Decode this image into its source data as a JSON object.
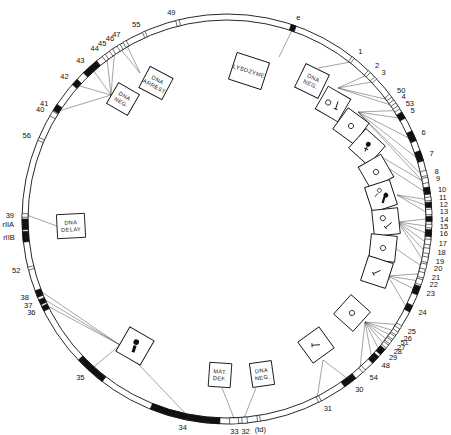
{
  "diagram": {
    "center": [
      227,
      219
    ],
    "outer_radius": 205,
    "inner_radius": 199,
    "colors": {
      "line": "#111111",
      "connector": "#333333",
      "background": "#ffffff",
      "gene_fill": "#111111"
    }
  },
  "genes": [
    {
      "label": "49",
      "angle": -14,
      "filled": false,
      "span": 1
    },
    {
      "label": "e",
      "angle": 19,
      "filled": true,
      "span": 1.5
    },
    {
      "label": "1",
      "angle": 38,
      "filled": false,
      "span": 0.8
    },
    {
      "label": "2",
      "angle": 44,
      "filled": false,
      "span": 0.8
    },
    {
      "label": "3",
      "angle": 46.5,
      "filled": false,
      "span": 0.8
    },
    {
      "label": "50",
      "angle": 53,
      "filled": false,
      "span": 1
    },
    {
      "label": "4",
      "angle": 55,
      "filled": false,
      "span": 1
    },
    {
      "label": "53",
      "angle": 57,
      "filled": false,
      "span": 1
    },
    {
      "label": "5",
      "angle": 59.5,
      "filled": true,
      "span": 2
    },
    {
      "label": "6",
      "angle": 66,
      "filled": true,
      "span": 3
    },
    {
      "label": "7",
      "angle": 72,
      "filled": true,
      "span": 3
    },
    {
      "label": "8",
      "angle": 77,
      "filled": false,
      "span": 1.5
    },
    {
      "label": "9",
      "angle": 79,
      "filled": false,
      "span": 1.5
    },
    {
      "label": "10",
      "angle": 82,
      "filled": true,
      "span": 2
    },
    {
      "label": "11",
      "angle": 84.3,
      "filled": false,
      "span": 1
    },
    {
      "label": "12",
      "angle": 86,
      "filled": true,
      "span": 1.5
    },
    {
      "label": "13",
      "angle": 88,
      "filled": false,
      "span": 1.5
    },
    {
      "label": "14",
      "angle": 90,
      "filled": true,
      "span": 1.5
    },
    {
      "label": "15",
      "angle": 92,
      "filled": false,
      "span": 1
    },
    {
      "label": "16",
      "angle": 94,
      "filled": true,
      "span": 2
    },
    {
      "label": "17",
      "angle": 96.5,
      "filled": false,
      "span": 1.5
    },
    {
      "label": "18",
      "angle": 99,
      "filled": false,
      "span": 1.5
    },
    {
      "label": "19",
      "angle": 101.5,
      "filled": false,
      "span": 1.5
    },
    {
      "label": "20",
      "angle": 103.5,
      "filled": false,
      "span": 1.5
    },
    {
      "label": "21",
      "angle": 106,
      "filled": false,
      "span": 1.5
    },
    {
      "label": "22",
      "angle": 108,
      "filled": false,
      "span": 1.5
    },
    {
      "label": "23",
      "angle": 110.5,
      "filled": true,
      "span": 2.5
    },
    {
      "label": "24",
      "angle": 116,
      "filled": true,
      "span": 2
    },
    {
      "label": "25",
      "angle": 122,
      "filled": false,
      "span": 1
    },
    {
      "label": "26",
      "angle": 124,
      "filled": false,
      "span": 1
    },
    {
      "label": "51",
      "angle": 125.5,
      "filled": false,
      "span": 1
    },
    {
      "label": "27",
      "angle": 127,
      "filled": false,
      "span": 1
    },
    {
      "label": "28",
      "angle": 128.5,
      "filled": false,
      "span": 1
    },
    {
      "label": "29",
      "angle": 130.5,
      "filled": true,
      "span": 2
    },
    {
      "label": "48",
      "angle": 133.5,
      "filled": true,
      "span": 2.5
    },
    {
      "label": "54",
      "angle": 138,
      "filled": false,
      "span": 1
    },
    {
      "label": "30",
      "angle": 143,
      "filled": true,
      "span": 4
    },
    {
      "label": "31",
      "angle": 153,
      "filled": false,
      "span": 0.8
    },
    {
      "label": "(td)",
      "angle": 171,
      "filled": false,
      "span": 0.8
    },
    {
      "label": "32",
      "angle": 175,
      "filled": false,
      "span": 1.5
    },
    {
      "label": "33",
      "angle": 178,
      "filled": false,
      "span": 2.5
    },
    {
      "label": "34",
      "angle": 192,
      "filled": true,
      "span": 20
    },
    {
      "label": "35",
      "angle": 222,
      "filled": true,
      "span": 9
    },
    {
      "label": "36",
      "angle": 244,
      "filled": true,
      "span": 1.5
    },
    {
      "label": "37",
      "angle": 246,
      "filled": true,
      "span": 1.5
    },
    {
      "label": "38",
      "angle": 248.5,
      "filled": true,
      "span": 2
    },
    {
      "label": "52",
      "angle": 256,
      "filled": false,
      "span": 0.8
    },
    {
      "label": "rIIB",
      "angle": 265,
      "filled": true,
      "span": 3
    },
    {
      "label": "rIIA",
      "angle": 268.5,
      "filled": true,
      "span": 3
    },
    {
      "label": "39",
      "angle": 271,
      "filled": false,
      "span": 1
    },
    {
      "label": "56",
      "angle": 293,
      "filled": false,
      "span": 0.8
    },
    {
      "label": "40",
      "angle": 301,
      "filled": false,
      "span": 1.5
    },
    {
      "label": "41",
      "angle": 303,
      "filled": true,
      "span": 2
    },
    {
      "label": "42",
      "angle": 312,
      "filled": true,
      "span": 2
    },
    {
      "label": "43",
      "angle": 318,
      "filled": true,
      "span": 5
    },
    {
      "label": "44",
      "angle": 323,
      "filled": false,
      "span": 1
    },
    {
      "label": "45",
      "angle": 325.5,
      "filled": false,
      "span": 1
    },
    {
      "label": "46",
      "angle": 328,
      "filled": false,
      "span": 1
    },
    {
      "label": "47",
      "angle": 330,
      "filled": false,
      "span": 1
    },
    {
      "label": "55",
      "angle": 336,
      "filled": false,
      "span": 0.8
    }
  ],
  "phenotype_boxes": [
    {
      "id": "lysozyme",
      "lines": [
        "LYSOZYME"
      ],
      "symbol": "none",
      "cx": 249,
      "cy": 71,
      "w": 34,
      "h": 28,
      "rot": 18,
      "anchor": [
        279,
        57
      ],
      "links": [
        "e"
      ]
    },
    {
      "id": "dna-neg-1",
      "lines": [
        "DNA",
        "NEG."
      ],
      "symbol": "none",
      "cx": 312,
      "cy": 81,
      "w": 26,
      "h": 26,
      "rot": 26,
      "anchor": [
        318,
        68
      ],
      "links": [
        "1"
      ]
    },
    {
      "id": "head-tail-1",
      "lines": [],
      "symbol": "head-tail",
      "cx": 333,
      "cy": 104,
      "w": 26,
      "h": 26,
      "rot": 30,
      "anchor": [
        338,
        88
      ],
      "links": [
        "2",
        "3",
        "50",
        "4"
      ]
    },
    {
      "id": "head-1",
      "lines": [],
      "symbol": "head",
      "cx": 351,
      "cy": 126,
      "w": 26,
      "h": 26,
      "rot": 36,
      "anchor": [
        358,
        112
      ],
      "links": [
        "53",
        "5",
        "6",
        "7",
        "8",
        "9"
      ]
    },
    {
      "id": "baseplate-1",
      "lines": [],
      "symbol": "no-tail-fiber",
      "cx": 367,
      "cy": 147,
      "w": 26,
      "h": 26,
      "rot": 42,
      "anchor": [
        370,
        150
      ],
      "links": [
        "9"
      ]
    },
    {
      "id": "head-2",
      "lines": [],
      "symbol": "head",
      "cx": 376,
      "cy": 172,
      "w": 26,
      "h": 26,
      "rot": 60,
      "anchor": [
        388,
        168
      ],
      "links": [
        "10"
      ]
    },
    {
      "id": "head-tail-fiber",
      "lines": [],
      "symbol": "head-tail-fiber",
      "cx": 381,
      "cy": 196,
      "w": 26,
      "h": 26,
      "rot": 72,
      "anchor": [
        397,
        195
      ],
      "links": [
        "11",
        "12",
        "13"
      ]
    },
    {
      "id": "head-tail-2",
      "lines": [],
      "symbol": "head-tail",
      "cx": 386,
      "cy": 222,
      "w": 26,
      "h": 26,
      "rot": 84,
      "anchor": [
        398,
        222
      ],
      "links": [
        "14",
        "15",
        "16",
        "17",
        "18",
        "19"
      ]
    },
    {
      "id": "head-3",
      "lines": [],
      "symbol": "head",
      "cx": 383,
      "cy": 248,
      "w": 26,
      "h": 26,
      "rot": 96,
      "anchor": [
        395,
        248
      ],
      "links": [
        "20"
      ]
    },
    {
      "id": "tail-1",
      "lines": [],
      "symbol": "tail",
      "cx": 377,
      "cy": 272,
      "w": 26,
      "h": 26,
      "rot": 108,
      "anchor": [
        388,
        276
      ],
      "links": [
        "21",
        "22",
        "23",
        "24"
      ]
    },
    {
      "id": "head-4",
      "lines": [],
      "symbol": "head",
      "cx": 352,
      "cy": 313,
      "w": 26,
      "h": 26,
      "rot": 132,
      "anchor": [
        365,
        322
      ],
      "links": [
        "25",
        "26",
        "51",
        "27",
        "28",
        "29",
        "48",
        "54"
      ]
    },
    {
      "id": "tail-2",
      "lines": [],
      "symbol": "tail",
      "cx": 316,
      "cy": 345,
      "w": 26,
      "h": 26,
      "rot": 144,
      "anchor": [
        323,
        360
      ],
      "links": [
        "30",
        "31"
      ]
    },
    {
      "id": "dna-neg-2",
      "lines": [
        "DNA",
        "NEG."
      ],
      "symbol": "none",
      "cx": 262,
      "cy": 374,
      "w": 22,
      "h": 24,
      "rot": -8,
      "anchor": [
        256,
        388
      ],
      "links": [
        "32"
      ]
    },
    {
      "id": "mat-def",
      "lines": [
        "MAT.",
        "DEF."
      ],
      "symbol": "none",
      "cx": 220,
      "cy": 375,
      "w": 22,
      "h": 24,
      "rot": 4,
      "anchor": [
        222,
        388
      ],
      "links": [
        "33"
      ]
    },
    {
      "id": "head-tail-fiber-2",
      "lines": [],
      "symbol": "tail-fiber-less",
      "cx": 135,
      "cy": 346,
      "w": 28,
      "h": 28,
      "rot": 30,
      "anchor": [
        120,
        345
      ],
      "links": [
        "34",
        "35",
        "36",
        "37",
        "38"
      ]
    },
    {
      "id": "dna-delay",
      "lines": [
        "DNA",
        "DELAY"
      ],
      "symbol": "none",
      "cx": 71,
      "cy": 226,
      "w": 28,
      "h": 24,
      "rot": -3,
      "anchor": [
        57,
        226
      ],
      "links": [
        "39"
      ]
    },
    {
      "id": "dna-neg-3",
      "lines": [
        "DNA",
        "NEG."
      ],
      "symbol": "none",
      "cx": 123,
      "cy": 99,
      "w": 24,
      "h": 24,
      "rot": 30,
      "anchor": [
        111,
        95
      ],
      "links": [
        "41",
        "42",
        "43",
        "44",
        "45"
      ]
    },
    {
      "id": "dna-arrest",
      "lines": [
        "DNA",
        "ARREST"
      ],
      "symbol": "none",
      "cx": 156,
      "cy": 83,
      "w": 26,
      "h": 24,
      "rot": 28,
      "anchor": [
        140,
        73
      ],
      "links": [
        "46",
        "47"
      ]
    }
  ]
}
